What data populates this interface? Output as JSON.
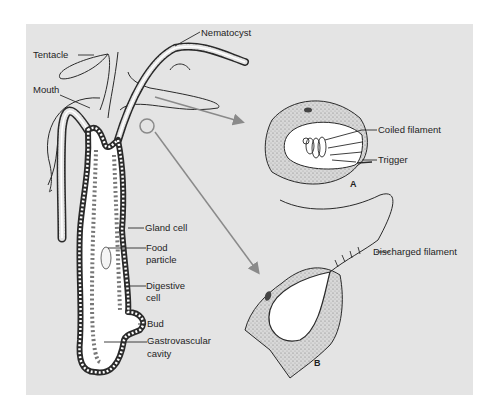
{
  "diagram": {
    "colors": {
      "panel_background": "#e4e4e4",
      "outline": "#2a2a2a",
      "cavity": "#ffffff",
      "pointer_arrow": "#8a8a8a"
    },
    "hydra_labels": {
      "tentacle": "Tentacle",
      "nematocyst": "Nematocyst",
      "mouth": "Mouth",
      "gland_cell": "Gland cell",
      "food_particle_line1": "Food",
      "food_particle_line2": "particle",
      "digestive_cell_line1": "Digestive",
      "digestive_cell_line2": "cell",
      "bud": "Bud",
      "gastrovascular_line1": "Gastrovascular",
      "gastrovascular_line2": "cavity"
    },
    "panel_a": {
      "figure_label": "A",
      "coiled_filament": "Coiled filament",
      "trigger": "Trigger"
    },
    "panel_b": {
      "figure_label": "B",
      "discharged_filament": "Discharged filament"
    }
  }
}
